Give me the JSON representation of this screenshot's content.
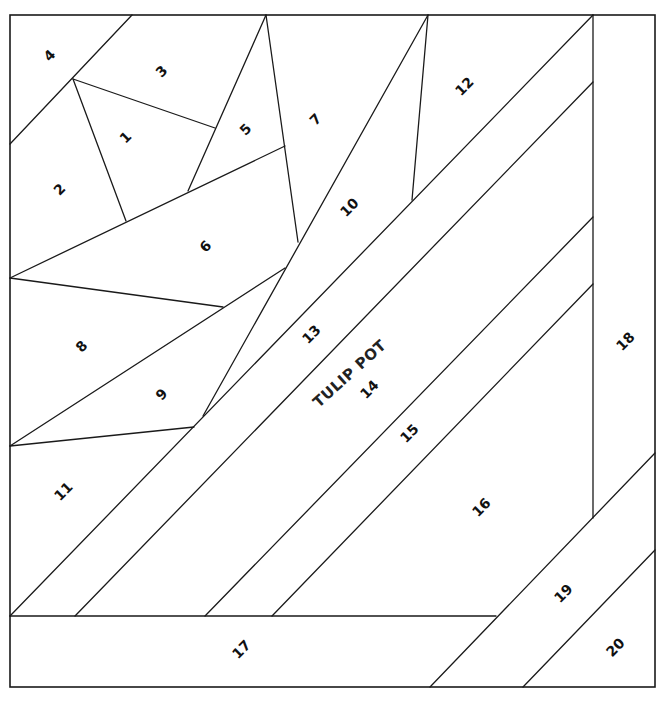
{
  "pattern": {
    "title": "TULIP POT",
    "line_color": "#1a1a1a",
    "background": "#ffffff"
  },
  "pieces": [
    {
      "number": "1",
      "label_x": 126,
      "label_y": 138
    },
    {
      "number": "2",
      "label_x": 60,
      "label_y": 190
    },
    {
      "number": "3",
      "label_x": 162,
      "label_y": 72
    },
    {
      "number": "4",
      "label_x": 50,
      "label_y": 56
    },
    {
      "number": "5",
      "label_x": 246,
      "label_y": 130
    },
    {
      "number": "6",
      "label_x": 206,
      "label_y": 247
    },
    {
      "number": "7",
      "label_x": 316,
      "label_y": 120
    },
    {
      "number": "8",
      "label_x": 82,
      "label_y": 347
    },
    {
      "number": "9",
      "label_x": 162,
      "label_y": 395
    },
    {
      "number": "10",
      "label_x": 350,
      "label_y": 208
    },
    {
      "number": "11",
      "label_x": 64,
      "label_y": 492
    },
    {
      "number": "12",
      "label_x": 465,
      "label_y": 87
    },
    {
      "number": "13",
      "label_x": 312,
      "label_y": 335
    },
    {
      "number": "14",
      "label_x": 370,
      "label_y": 390
    },
    {
      "number": "15",
      "label_x": 410,
      "label_y": 434
    },
    {
      "number": "16",
      "label_x": 482,
      "label_y": 508
    },
    {
      "number": "17",
      "label_x": 242,
      "label_y": 650
    },
    {
      "number": "18",
      "label_x": 626,
      "label_y": 342
    },
    {
      "number": "19",
      "label_x": 564,
      "label_y": 594
    },
    {
      "number": "20",
      "label_x": 616,
      "label_y": 648
    }
  ],
  "title_label": {
    "x": 350,
    "y": 374,
    "rotate": -42
  }
}
